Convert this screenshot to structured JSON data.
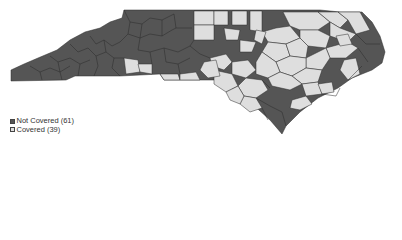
{
  "map": {
    "region": "North Carolina counties",
    "colors": {
      "not_covered": "#555555",
      "covered": "#dedede",
      "border": "#2b2b2b"
    }
  },
  "legend": {
    "items": [
      {
        "label": "Not Covered (61)",
        "color": "#555555"
      },
      {
        "label": "Covered (39)",
        "color": "#dedede"
      }
    ]
  }
}
